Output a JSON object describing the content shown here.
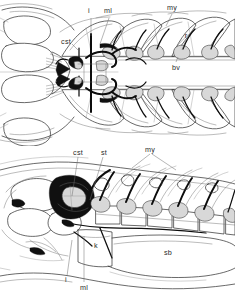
{
  "figure": {
    "background_color": "#ffffff",
    "ink_color": "#101010",
    "line_color": "#2f2f2f",
    "width": 235,
    "height": 292,
    "panels": [
      {
        "id": "panel-top",
        "view": "dorsal",
        "labels": [
          {
            "key": "i",
            "text": "i",
            "x": 89,
            "y": 13
          },
          {
            "key": "ml",
            "text": "ml",
            "x": 105,
            "y": 13
          },
          {
            "key": "my",
            "text": "my",
            "x": 166,
            "y": 9
          },
          {
            "key": "cst",
            "text": "cst",
            "x": 60,
            "y": 41
          },
          {
            "key": "r",
            "text": "r",
            "x": 185,
            "y": 36
          },
          {
            "key": "bv",
            "text": "bv",
            "x": 170,
            "y": 68
          }
        ]
      },
      {
        "id": "panel-bottom",
        "view": "lateral",
        "labels": [
          {
            "key": "cst",
            "text": "cst",
            "x": 72,
            "y": 152
          },
          {
            "key": "st",
            "text": "st",
            "x": 100,
            "y": 152
          },
          {
            "key": "my",
            "text": "my",
            "x": 146,
            "y": 149
          },
          {
            "key": "k",
            "text": "k",
            "x": 96,
            "y": 245
          },
          {
            "key": "sb",
            "text": "sb",
            "x": 166,
            "y": 252
          },
          {
            "key": "i",
            "text": "i",
            "x": 66,
            "y": 281
          },
          {
            "key": "ml",
            "text": "ml",
            "x": 83,
            "y": 288
          }
        ]
      }
    ],
    "legend_keys": [
      {
        "abbr": "i",
        "meaning": "intercalarium"
      },
      {
        "abbr": "ml",
        "meaning": "manubrium / ligament"
      },
      {
        "abbr": "my",
        "meaning": "myomere"
      },
      {
        "abbr": "cst",
        "meaning": "compound supraneural tripus"
      },
      {
        "abbr": "st",
        "meaning": "supraneural"
      },
      {
        "abbr": "r",
        "meaning": "rib"
      },
      {
        "abbr": "bv",
        "meaning": "blood vessel"
      },
      {
        "abbr": "k",
        "meaning": "kidney"
      },
      {
        "abbr": "sb",
        "meaning": "swim bladder"
      }
    ]
  }
}
